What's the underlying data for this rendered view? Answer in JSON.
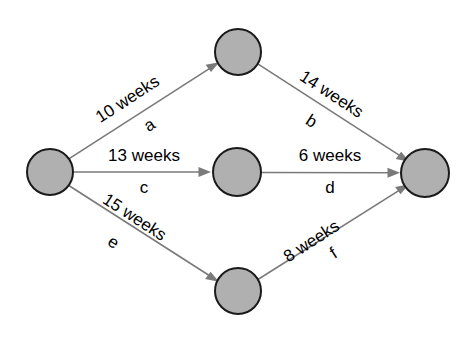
{
  "diagram": {
    "type": "activity-on-arrow network diagram",
    "background_color": "#ffffff",
    "node_fill_color": "#b0b0b0",
    "node_stroke_color": "#1a1a1a",
    "edge_color": "#7a7a7a",
    "text_color": "#000000",
    "nodes": [
      {
        "id": "start",
        "label": "",
        "cx": 50,
        "cy": 172,
        "r": 23
      },
      {
        "id": "top",
        "label": "",
        "cx": 238,
        "cy": 52,
        "r": 23
      },
      {
        "id": "middle",
        "label": "",
        "cx": 237,
        "cy": 172,
        "r": 24
      },
      {
        "id": "bottom",
        "label": "",
        "cx": 238,
        "cy": 291,
        "r": 23
      },
      {
        "id": "end",
        "label": "",
        "cx": 425,
        "cy": 173,
        "r": 24
      }
    ],
    "edges": [
      {
        "id": "a",
        "from": "start",
        "to": "top",
        "weight_label": "10 weeks",
        "activity_label": "a",
        "duration_value": 10,
        "duration_unit": "weeks",
        "label_rotation_deg": -33,
        "weight_x": 128,
        "weight_y": 100,
        "activity_x": 150,
        "activity_y": 126
      },
      {
        "id": "b",
        "from": "top",
        "to": "end",
        "weight_label": "14 weeks",
        "activity_label": "b",
        "duration_value": 14,
        "duration_unit": "weeks",
        "label_rotation_deg": 33,
        "weight_x": 331,
        "weight_y": 95,
        "activity_x": 311,
        "activity_y": 122
      },
      {
        "id": "c",
        "from": "start",
        "to": "middle",
        "weight_label": "13 weeks",
        "activity_label": "c",
        "duration_value": 13,
        "duration_unit": "weeks",
        "label_rotation_deg": 0,
        "weight_x": 144,
        "weight_y": 157,
        "activity_x": 144,
        "activity_y": 189
      },
      {
        "id": "d",
        "from": "middle",
        "to": "end",
        "weight_label": "6 weeks",
        "activity_label": "d",
        "duration_value": 6,
        "duration_unit": "weeks",
        "label_rotation_deg": 0,
        "weight_x": 330,
        "weight_y": 157,
        "activity_x": 330,
        "activity_y": 189
      },
      {
        "id": "e",
        "from": "start",
        "to": "bottom",
        "weight_label": "15 weeks",
        "activity_label": "e",
        "duration_value": 15,
        "duration_unit": "weeks",
        "label_rotation_deg": 33,
        "weight_x": 134,
        "weight_y": 218,
        "activity_x": 113,
        "activity_y": 243
      },
      {
        "id": "f",
        "from": "bottom",
        "to": "end",
        "weight_label": "8 weeks",
        "activity_label": "f",
        "duration_value": 8,
        "duration_unit": "weeks",
        "label_rotation_deg": -33,
        "weight_x": 312,
        "weight_y": 242,
        "activity_x": 334,
        "activity_y": 254
      }
    ]
  }
}
